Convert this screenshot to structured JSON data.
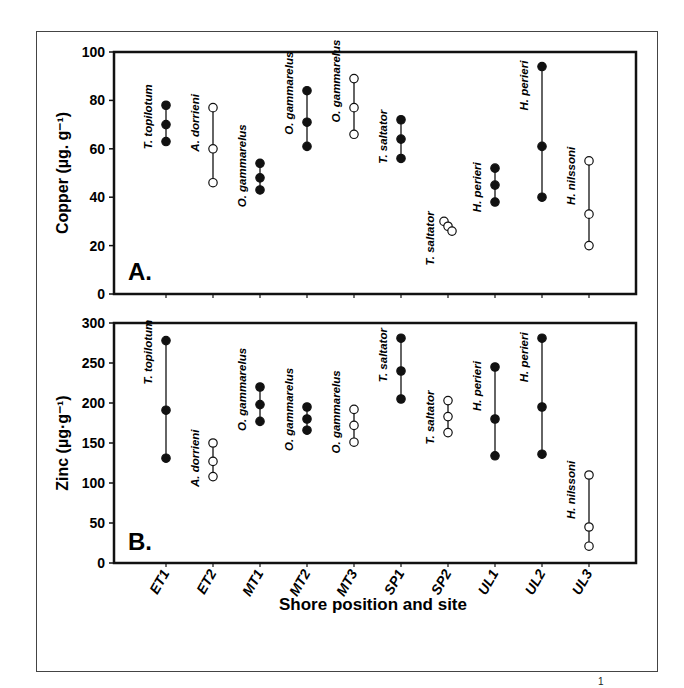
{
  "figure": {
    "xlabel": "Shore position and site",
    "footnote_fragment": "1"
  },
  "chart_data": [
    {
      "type": "scatter",
      "panel_label": "A.",
      "title": "",
      "xlabel": "Shore position and site",
      "ylabel": "Copper (µg. g⁻¹)",
      "ylim": [
        0,
        100
      ],
      "yticks": [
        0,
        20,
        40,
        60,
        80,
        100
      ],
      "grid": false,
      "legend": "none",
      "categories": [
        "ET1",
        "ET2",
        "MT1",
        "MT2",
        "MT3",
        "SP1",
        "SP2",
        "UL1",
        "UL2",
        "UL3"
      ],
      "series": [
        {
          "site": "ET1",
          "species": "T. topilotum",
          "filled": true,
          "values": [
            78,
            70,
            63
          ]
        },
        {
          "site": "ET2",
          "species": "A. dorrieni",
          "filled": false,
          "values": [
            77,
            60,
            46
          ]
        },
        {
          "site": "MT1",
          "species": "O. gammarelus",
          "filled": true,
          "values": [
            54,
            48,
            43
          ]
        },
        {
          "site": "MT2",
          "species": "O. gammarelus",
          "filled": true,
          "values": [
            84,
            71,
            61
          ]
        },
        {
          "site": "MT3",
          "species": "O. gammarelus",
          "filled": false,
          "values": [
            89,
            77,
            66
          ]
        },
        {
          "site": "SP1",
          "species": "T. saltator",
          "filled": true,
          "values": [
            72,
            64,
            56
          ]
        },
        {
          "site": "SP2",
          "species": "T. saltator",
          "filled": false,
          "values": [
            30,
            28,
            26
          ]
        },
        {
          "site": "UL1",
          "species": "H. perieri",
          "filled": true,
          "values": [
            52,
            45,
            38
          ]
        },
        {
          "site": "UL2",
          "species": "H. perieri",
          "filled": true,
          "values": [
            94,
            61,
            40
          ]
        },
        {
          "site": "UL3",
          "species": "H. nilssoni",
          "filled": false,
          "values": [
            55,
            33,
            20
          ]
        }
      ]
    },
    {
      "type": "scatter",
      "panel_label": "B.",
      "title": "",
      "xlabel": "Shore position and site",
      "ylabel": "Zinc (µg·g⁻¹)",
      "ylim": [
        0,
        300
      ],
      "yticks": [
        0,
        50,
        100,
        150,
        200,
        250,
        300
      ],
      "grid": false,
      "legend": "none",
      "categories": [
        "ET1",
        "ET2",
        "MT1",
        "MT2",
        "MT3",
        "SP1",
        "SP2",
        "UL1",
        "UL2",
        "UL3"
      ],
      "series": [
        {
          "site": "ET1",
          "species": "T. topilotum",
          "filled": true,
          "values": [
            278,
            191,
            131
          ]
        },
        {
          "site": "ET2",
          "species": "A. dorrieni",
          "filled": false,
          "values": [
            150,
            127,
            108
          ]
        },
        {
          "site": "MT1",
          "species": "O. gammarelus",
          "filled": true,
          "values": [
            220,
            198,
            177
          ]
        },
        {
          "site": "MT2",
          "species": "O. gammarelus",
          "filled": true,
          "values": [
            195,
            180,
            166
          ]
        },
        {
          "site": "MT3",
          "species": "O. gammarelus",
          "filled": false,
          "values": [
            192,
            172,
            151
          ]
        },
        {
          "site": "SP1",
          "species": "T. saltator",
          "filled": true,
          "values": [
            281,
            240,
            205
          ]
        },
        {
          "site": "SP2",
          "species": "T. saltator",
          "filled": false,
          "values": [
            203,
            183,
            163
          ]
        },
        {
          "site": "UL1",
          "species": "H. perieri",
          "filled": true,
          "values": [
            245,
            180,
            134
          ]
        },
        {
          "site": "UL2",
          "species": "H. perieri",
          "filled": true,
          "values": [
            281,
            195,
            136
          ]
        },
        {
          "site": "UL3",
          "species": "H. nilssoni",
          "filled": false,
          "values": [
            110,
            45,
            21
          ]
        }
      ]
    }
  ]
}
